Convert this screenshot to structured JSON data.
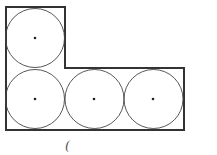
{
  "diagram": {
    "outline_color": "#333333",
    "circle_color": "#444444",
    "outline": [
      [
        6,
        7
      ],
      [
        65,
        7
      ],
      [
        65,
        68
      ],
      [
        184,
        68
      ],
      [
        184,
        130
      ],
      [
        6,
        130
      ]
    ],
    "circles": [
      {
        "cx": 35,
        "cy": 38,
        "r": 30
      },
      {
        "cx": 35,
        "cy": 99,
        "r": 30
      },
      {
        "cx": 94,
        "cy": 99,
        "r": 30
      },
      {
        "cx": 153,
        "cy": 99,
        "r": 30
      }
    ],
    "stray_mark": "("
  }
}
